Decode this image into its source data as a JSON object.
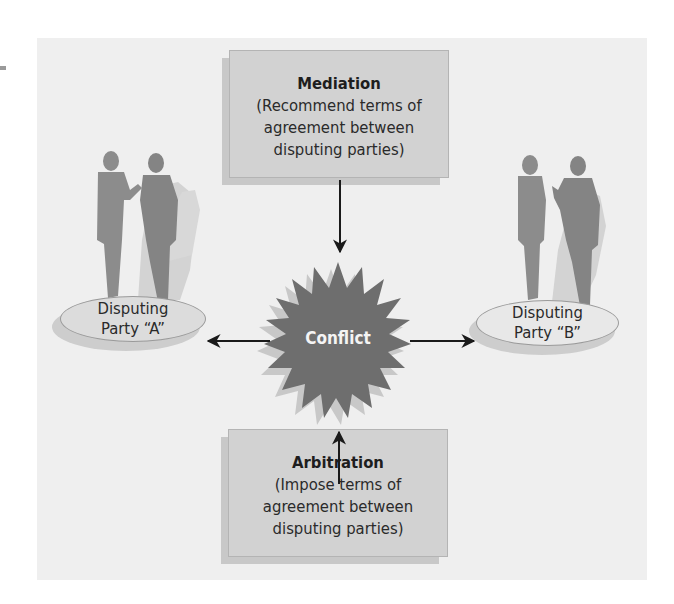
{
  "diagram": {
    "center": {
      "label": "Conflict",
      "color": "#6e6e6e"
    },
    "mediation": {
      "title": "Mediation",
      "lines": [
        "(Recommend terms of",
        "agreement between",
        "disputing parties)"
      ]
    },
    "arbitration": {
      "title": "Arbitration",
      "lines": [
        "(Impose terms of",
        "agreement between",
        "disputing parties)"
      ]
    },
    "party_a": {
      "line1": "Disputing",
      "line2": "Party “A”"
    },
    "party_b": {
      "line1": "Disputing",
      "line2": "Party “B”"
    },
    "colors": {
      "panel": "#efefef",
      "box_fill": "#d2d2d2",
      "ellipse_a_fill": "#dcdcdc",
      "ellipse_b_fill": "#e8e8e8",
      "silhouette": "#8c8c8c",
      "silhouette_shadow": "#cfcfcf",
      "arrow": "#1a1a1a"
    }
  }
}
